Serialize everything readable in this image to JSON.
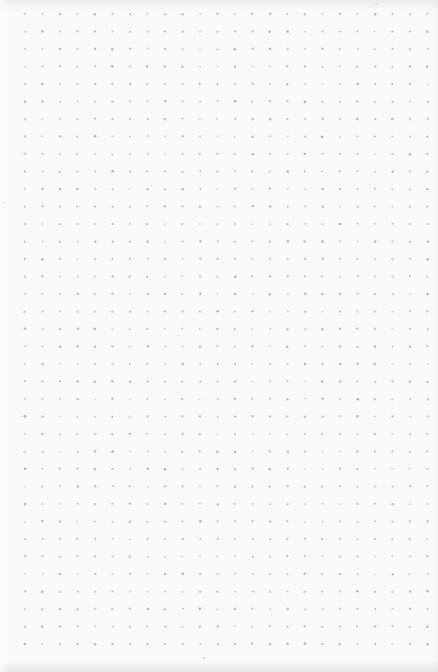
{
  "page": {
    "width_px": 438,
    "height_px": 672,
    "background_color": "#fafaf9",
    "edge_shading_color": "#8a8a87"
  },
  "dot_grid": {
    "columns": 24,
    "rows": 37,
    "origin_x": 25,
    "origin_y": 14,
    "spacing_x": 17.5,
    "spacing_y": 17.5,
    "dot_radius_px": 1.05,
    "dot_color": "#9d9d9c",
    "dot_min_opacity": 0.42,
    "dot_max_opacity": 0.82,
    "position_jitter_px": 0.35
  },
  "specks": [
    {
      "x": 3,
      "y": 202
    },
    {
      "x": 375,
      "y": 3
    },
    {
      "x": 203,
      "y": 657
    }
  ],
  "speck_color": "#b3b3b0"
}
